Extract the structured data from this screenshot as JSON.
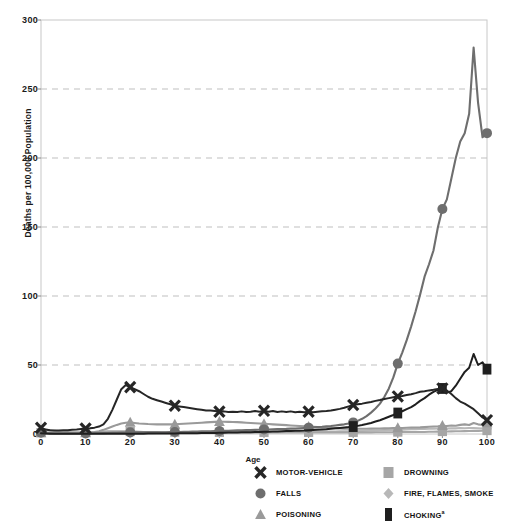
{
  "chart_data": {
    "type": "line",
    "title": "",
    "xlabel": "Age",
    "ylabel": "Deaths per 100,000 Population",
    "xlim": [
      0,
      100
    ],
    "ylim": [
      0,
      300
    ],
    "xticks": [
      0,
      10,
      20,
      30,
      40,
      50,
      60,
      70,
      80,
      90,
      100
    ],
    "yticks": [
      0,
      50,
      100,
      150,
      200,
      250,
      300
    ],
    "grid": "horizontal-dashed",
    "legend_position": "bottom-right",
    "x": [
      0,
      1,
      2,
      3,
      4,
      5,
      6,
      7,
      8,
      9,
      10,
      11,
      12,
      13,
      14,
      15,
      16,
      17,
      18,
      19,
      20,
      21,
      22,
      23,
      24,
      25,
      26,
      27,
      28,
      29,
      30,
      31,
      32,
      33,
      34,
      35,
      36,
      37,
      38,
      39,
      40,
      41,
      42,
      43,
      44,
      45,
      46,
      47,
      48,
      49,
      50,
      51,
      52,
      53,
      54,
      55,
      56,
      57,
      58,
      59,
      60,
      61,
      62,
      63,
      64,
      65,
      66,
      67,
      68,
      69,
      70,
      71,
      72,
      73,
      74,
      75,
      76,
      77,
      78,
      79,
      80,
      81,
      82,
      83,
      84,
      85,
      86,
      87,
      88,
      89,
      90,
      91,
      92,
      93,
      94,
      95,
      96,
      97,
      98,
      99,
      100
    ],
    "series": [
      {
        "name": "MOTOR-VEHICLE",
        "marker": "x",
        "color": "#262626",
        "marker_x": [
          0,
          10,
          20,
          30,
          40,
          50,
          60,
          70,
          80,
          90,
          100
        ],
        "values": [
          4.5,
          3.2,
          2.8,
          2.6,
          2.6,
          2.7,
          2.8,
          3.0,
          3.2,
          3.6,
          4.0,
          4.2,
          4.6,
          5.4,
          7.0,
          11.0,
          17.5,
          25.0,
          32.5,
          35.5,
          34.0,
          32.5,
          31.0,
          29.0,
          27.0,
          25.5,
          24.5,
          23.5,
          22.5,
          21.5,
          20.5,
          20.0,
          19.5,
          19.0,
          18.5,
          18.0,
          17.5,
          17.0,
          17.0,
          16.6,
          16.2,
          16.4,
          16.0,
          16.2,
          16.0,
          16.4,
          16.0,
          16.2,
          16.6,
          16.2,
          16.8,
          16.2,
          16.6,
          16.0,
          16.4,
          16.0,
          16.4,
          15.8,
          16.2,
          15.8,
          16.2,
          15.8,
          16.2,
          16.4,
          16.6,
          17.0,
          17.6,
          18.2,
          19.0,
          20.0,
          21.0,
          21.5,
          22.0,
          22.6,
          23.2,
          24.0,
          24.6,
          25.4,
          26.0,
          26.6,
          27.2,
          27.6,
          28.2,
          28.8,
          29.6,
          30.6,
          31.0,
          31.6,
          32.0,
          32.6,
          33.0,
          31.5,
          29.0,
          26.0,
          23.5,
          22.0,
          20.0,
          18.0,
          15.0,
          12.0,
          10.0
        ]
      },
      {
        "name": "FALLS",
        "marker": "circle",
        "color": "#6e6e6e",
        "marker_x": [
          0,
          10,
          20,
          30,
          40,
          50,
          60,
          70,
          80,
          90,
          100
        ],
        "values": [
          1.0,
          0.6,
          0.5,
          0.4,
          0.4,
          0.4,
          0.4,
          0.4,
          0.4,
          0.4,
          0.4,
          0.4,
          0.5,
          0.5,
          0.6,
          0.7,
          0.8,
          0.9,
          1.0,
          1.1,
          1.2,
          1.2,
          1.2,
          1.2,
          1.2,
          1.2,
          1.3,
          1.3,
          1.3,
          1.4,
          1.5,
          1.5,
          1.6,
          1.6,
          1.7,
          1.8,
          1.9,
          2.0,
          2.0,
          2.1,
          2.2,
          2.3,
          2.4,
          2.5,
          2.6,
          2.7,
          2.8,
          2.9,
          3.0,
          3.1,
          3.2,
          3.3,
          3.4,
          3.5,
          3.6,
          3.7,
          3.9,
          4.0,
          4.2,
          4.4,
          4.6,
          4.8,
          5.0,
          5.2,
          5.5,
          5.8,
          6.2,
          6.6,
          7.0,
          7.6,
          8.4,
          9.5,
          11.0,
          13.0,
          15.5,
          18.5,
          22.0,
          27.0,
          33.0,
          41.0,
          51.0,
          59.0,
          68.0,
          78.0,
          89.0,
          101.0,
          114.0,
          123.0,
          133.0,
          150.0,
          163.0,
          170.0,
          185.0,
          200.0,
          212.0,
          218.0,
          232.0,
          280.0,
          240.0,
          215.0,
          218.0
        ]
      },
      {
        "name": "POISONING",
        "marker": "triangle",
        "color": "#9a9a9a",
        "marker_x": [
          0,
          10,
          20,
          30,
          40,
          50,
          60,
          70,
          80,
          90,
          100
        ],
        "values": [
          0.8,
          0.5,
          0.4,
          0.4,
          0.4,
          0.4,
          0.4,
          0.4,
          0.5,
          0.6,
          0.8,
          1.0,
          1.4,
          2.0,
          3.0,
          4.2,
          5.4,
          6.6,
          7.6,
          8.2,
          8.4,
          8.0,
          7.6,
          7.4,
          7.2,
          7.1,
          7.0,
          7.0,
          7.0,
          7.0,
          7.0,
          7.2,
          7.4,
          7.6,
          7.8,
          8.0,
          8.2,
          8.4,
          8.6,
          8.8,
          9.0,
          8.9,
          8.8,
          8.7,
          8.6,
          8.4,
          8.2,
          8.0,
          7.8,
          7.6,
          7.4,
          7.2,
          7.0,
          6.8,
          6.6,
          6.4,
          6.2,
          6.0,
          5.8,
          5.6,
          5.4,
          5.2,
          5.0,
          4.8,
          4.6,
          4.4,
          4.2,
          4.0,
          3.9,
          3.8,
          3.8,
          3.8,
          3.8,
          3.8,
          3.9,
          4.0,
          4.0,
          4.1,
          4.2,
          4.3,
          4.4,
          4.4,
          4.5,
          4.6,
          4.7,
          4.8,
          5.0,
          5.2,
          5.4,
          5.6,
          6.0,
          5.8,
          6.2,
          6.0,
          6.6,
          7.0,
          6.5,
          8.0,
          7.0,
          6.5,
          8.0
        ]
      },
      {
        "name": "DROWNING",
        "marker": "square",
        "color": "#a6a6a6",
        "marker_x": [
          0,
          10,
          20,
          30,
          40,
          50,
          60,
          70,
          80,
          90,
          100
        ],
        "values": [
          1.0,
          3.0,
          2.8,
          2.4,
          2.0,
          1.7,
          1.5,
          1.3,
          1.2,
          1.2,
          1.2,
          1.2,
          1.3,
          1.5,
          1.7,
          1.9,
          2.0,
          2.0,
          2.0,
          1.9,
          1.8,
          1.7,
          1.6,
          1.5,
          1.5,
          1.4,
          1.4,
          1.3,
          1.3,
          1.3,
          1.3,
          1.2,
          1.2,
          1.2,
          1.2,
          1.2,
          1.2,
          1.2,
          1.2,
          1.2,
          1.2,
          1.2,
          1.2,
          1.2,
          1.2,
          1.2,
          1.2,
          1.2,
          1.2,
          1.2,
          1.2,
          1.2,
          1.2,
          1.2,
          1.2,
          1.2,
          1.2,
          1.2,
          1.2,
          1.2,
          1.2,
          1.2,
          1.2,
          1.2,
          1.2,
          1.2,
          1.2,
          1.2,
          1.2,
          1.2,
          1.2,
          1.2,
          1.2,
          1.2,
          1.2,
          1.3,
          1.3,
          1.3,
          1.3,
          1.3,
          1.4,
          1.4,
          1.4,
          1.4,
          1.5,
          1.5,
          1.5,
          1.6,
          1.6,
          1.7,
          1.8,
          1.8,
          1.9,
          2.0,
          2.0,
          2.1,
          2.2,
          2.3,
          2.3,
          2.4,
          2.5
        ]
      },
      {
        "name": "FIRE, FLAMES, SMOKE",
        "marker": "diamond",
        "color": "#b8b8b8",
        "marker_x": [
          0,
          10,
          20,
          30,
          40,
          50,
          60,
          70,
          80,
          90,
          100
        ],
        "values": [
          1.2,
          1.2,
          1.1,
          1.0,
          0.9,
          0.9,
          0.8,
          0.8,
          0.7,
          0.7,
          0.7,
          0.6,
          0.6,
          0.6,
          0.6,
          0.6,
          0.6,
          0.6,
          0.6,
          0.6,
          0.6,
          0.6,
          0.6,
          0.6,
          0.6,
          0.6,
          0.7,
          0.7,
          0.7,
          0.7,
          0.8,
          0.8,
          0.8,
          0.8,
          0.9,
          0.9,
          0.9,
          0.9,
          1.0,
          1.0,
          1.0,
          1.0,
          1.1,
          1.1,
          1.1,
          1.1,
          1.2,
          1.2,
          1.2,
          1.2,
          1.3,
          1.3,
          1.3,
          1.3,
          1.4,
          1.4,
          1.4,
          1.5,
          1.5,
          1.5,
          1.6,
          1.6,
          1.6,
          1.7,
          1.7,
          1.8,
          1.8,
          1.9,
          2.0,
          2.0,
          2.1,
          2.2,
          2.3,
          2.4,
          2.5,
          2.6,
          2.7,
          2.8,
          2.9,
          3.0,
          3.1,
          3.2,
          3.3,
          3.4,
          3.5,
          3.6,
          3.7,
          3.8,
          3.9,
          4.0,
          4.1,
          4.0,
          4.2,
          4.1,
          4.3,
          4.2,
          4.4,
          4.3,
          4.2,
          4.0,
          3.8
        ]
      },
      {
        "name": "CHOKING",
        "marker": "square-dark",
        "color": "#1f1f1f",
        "marker_x": [
          70,
          80,
          90,
          100
        ],
        "values": [
          0.6,
          0.3,
          0.2,
          0.2,
          0.2,
          0.2,
          0.2,
          0.2,
          0.2,
          0.2,
          0.2,
          0.2,
          0.2,
          0.2,
          0.2,
          0.2,
          0.2,
          0.2,
          0.2,
          0.2,
          0.2,
          0.2,
          0.2,
          0.2,
          0.3,
          0.3,
          0.3,
          0.3,
          0.4,
          0.4,
          0.4,
          0.5,
          0.5,
          0.5,
          0.6,
          0.6,
          0.7,
          0.7,
          0.8,
          0.8,
          0.9,
          0.9,
          1.0,
          1.0,
          1.1,
          1.2,
          1.3,
          1.3,
          1.4,
          1.5,
          1.6,
          1.7,
          1.8,
          1.9,
          2.0,
          2.1,
          2.2,
          2.3,
          2.4,
          2.5,
          2.7,
          2.9,
          3.1,
          3.3,
          3.5,
          3.8,
          4.1,
          4.4,
          4.7,
          5.0,
          5.4,
          5.9,
          6.5,
          7.2,
          8.0,
          9.0,
          10.0,
          11.2,
          12.5,
          13.8,
          15.2,
          16.5,
          18.0,
          19.5,
          21.5,
          24.0,
          26.0,
          28.5,
          30.5,
          32.0,
          33.0,
          30.0,
          31.0,
          35.0,
          40.0,
          45.0,
          48.0,
          58.0,
          50.0,
          52.0,
          47.0
        ]
      }
    ]
  },
  "axis": {
    "ylabel": "Deaths per 100,000 Population",
    "xlabel": "Age",
    "yticks": [
      "0",
      "50",
      "100",
      "150",
      "200",
      "250",
      "300"
    ],
    "xticks": [
      "0",
      "10",
      "20",
      "30",
      "40",
      "50",
      "60",
      "70",
      "80",
      "90",
      "100"
    ]
  },
  "legend": {
    "items": [
      {
        "label": "MOTOR-VEHICLE",
        "marker": "x",
        "color": "#262626",
        "superscript": ""
      },
      {
        "label": "DROWNING",
        "marker": "square",
        "color": "#a6a6a6",
        "superscript": ""
      },
      {
        "label": "FALLS",
        "marker": "circle",
        "color": "#6e6e6e",
        "superscript": ""
      },
      {
        "label": "FIRE, FLAMES, SMOKE",
        "marker": "diamond",
        "color": "#b8b8b8",
        "superscript": ""
      },
      {
        "label": "POISONING",
        "marker": "triangle",
        "color": "#9a9a9a",
        "superscript": ""
      },
      {
        "label": "CHOKING",
        "marker": "square-dark",
        "color": "#1f1f1f",
        "superscript": "a"
      }
    ]
  },
  "style": {
    "plot_border_color": "#c8c8c8",
    "grid_color": "#bfbfbf",
    "background": "#ffffff"
  }
}
